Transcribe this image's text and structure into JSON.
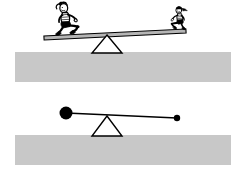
{
  "figure": {
    "background_color": "#ffffff",
    "width": 242,
    "height": 174
  },
  "colors": {
    "ground": "#c8c8c8",
    "ground_edge": "#bdbdbd",
    "ink": "#000000",
    "plank_fill": "#b5b5b5",
    "fulcrum_fill": "#ffffff",
    "mass_fill": "#000000"
  },
  "panels": [
    {
      "id": "seesaw-panel",
      "label": "Seesaw with two children",
      "ground": {
        "x": 15,
        "y": 52,
        "width": 216,
        "height": 30
      },
      "fulcrum": {
        "apex_x": 107,
        "apex_y": 35,
        "base_left_x": 92,
        "base_right_x": 122,
        "base_y": 53,
        "label": "pivot"
      },
      "plank": {
        "left_x": 44,
        "left_y": 38,
        "right_x": 186,
        "right_y": 31,
        "thickness": 4,
        "label": "seesaw plank"
      },
      "riders": [
        {
          "id": "child-left",
          "side": "left",
          "label": "child sitting on left end",
          "cx": 66,
          "cy": 22,
          "scale": 1.12
        },
        {
          "id": "child-right",
          "side": "right",
          "label": "child sitting on right end",
          "cx": 180,
          "cy": 20,
          "scale": 0.86
        }
      ]
    },
    {
      "id": "lever-panel",
      "label": "Abstract lever with two masses",
      "ground": {
        "x": 15,
        "y": 135,
        "width": 216,
        "height": 30
      },
      "fulcrum": {
        "apex_x": 107,
        "apex_y": 116,
        "base_left_x": 92,
        "base_right_x": 122,
        "base_y": 136,
        "label": "pivot"
      },
      "beam": {
        "left_x": 66,
        "left_y": 113,
        "right_x": 177,
        "right_y": 118,
        "thickness": 1.6,
        "label": "lever beam"
      },
      "masses": [
        {
          "id": "mass-left",
          "side": "left",
          "label": "large mass",
          "cx": 66,
          "cy": 113,
          "r": 6.5
        },
        {
          "id": "mass-right",
          "side": "right",
          "label": "small mass",
          "cx": 177,
          "cy": 118,
          "r": 3.2
        }
      ]
    }
  ]
}
